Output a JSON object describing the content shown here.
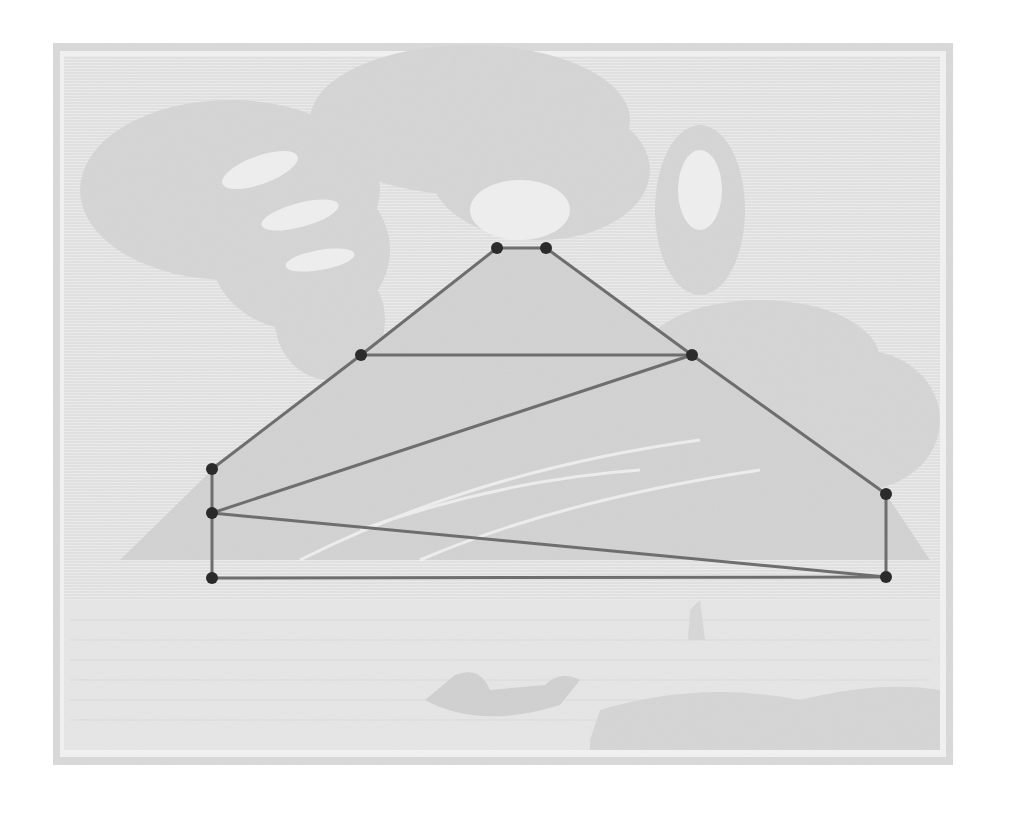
{
  "canvas": {
    "width": 1014,
    "height": 814,
    "background": "#ffffff"
  },
  "engraving": {
    "subject": "erupting volcano engraving (faded background)",
    "outer_frame": {
      "x": 53,
      "y": 43,
      "w": 900,
      "h": 722
    },
    "inner_frame": {
      "x": 64,
      "y": 56,
      "w": 876,
      "h": 694
    },
    "colors": {
      "fill": "#dcdcdc",
      "frame_fill": "#d6d6d6",
      "dark_tone": "#cfcfcf",
      "highlight": "#f4f4f4"
    }
  },
  "diagram": {
    "line_color": "#6e6e6e",
    "line_width": 3,
    "point_color": "#2b2b2b",
    "point_radius": 6,
    "points": [
      {
        "id": "A",
        "x": 497,
        "y": 248
      },
      {
        "id": "B",
        "x": 546,
        "y": 248
      },
      {
        "id": "C",
        "x": 361,
        "y": 355
      },
      {
        "id": "D",
        "x": 692,
        "y": 355
      },
      {
        "id": "E",
        "x": 212,
        "y": 469
      },
      {
        "id": "F",
        "x": 212,
        "y": 513
      },
      {
        "id": "G",
        "x": 212,
        "y": 578
      },
      {
        "id": "H",
        "x": 886,
        "y": 494
      },
      {
        "id": "I",
        "x": 886,
        "y": 577
      }
    ],
    "edges": [
      [
        "A",
        "B"
      ],
      [
        "A",
        "C"
      ],
      [
        "C",
        "E"
      ],
      [
        "B",
        "D"
      ],
      [
        "D",
        "H"
      ],
      [
        "C",
        "D"
      ],
      [
        "D",
        "F"
      ],
      [
        "E",
        "F"
      ],
      [
        "F",
        "G"
      ],
      [
        "F",
        "I"
      ],
      [
        "G",
        "I"
      ],
      [
        "H",
        "I"
      ]
    ]
  }
}
